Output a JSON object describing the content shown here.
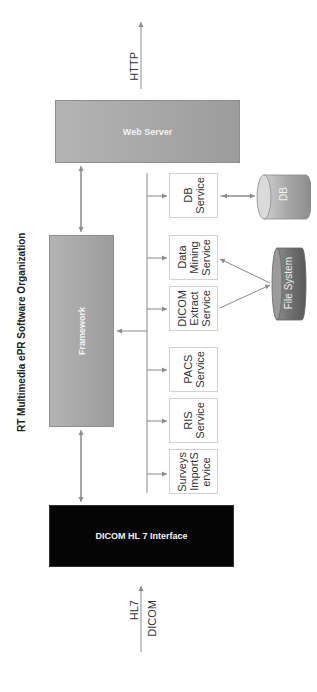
{
  "title": "RT Multimedia ePR Software Organization",
  "protocols": {
    "top": "HTTP",
    "bottom_left": "HL7",
    "bottom_right": "DICOM"
  },
  "components": {
    "web_server": "Web Server",
    "framework": "Framework",
    "interface": "DICOM HL 7 Interface"
  },
  "services": [
    {
      "id": "db",
      "label": "DB\nService"
    },
    {
      "id": "data-mining",
      "label": "Data\nMining\nService"
    },
    {
      "id": "dicom-extract",
      "label": "DICOM\nExtract\nService"
    },
    {
      "id": "pacs",
      "label": "PACS\nService"
    },
    {
      "id": "ris",
      "label": "RIS\nService"
    },
    {
      "id": "surveys-import",
      "label": "Surveys\nImportS\nervice"
    }
  ],
  "storage": {
    "db": "DB",
    "file_system": "File System"
  },
  "colors": {
    "grey_box": "#a8a8a8",
    "black_box": "#050505",
    "line": "#8a8a8a",
    "cylinder_light": "#b8b8b8",
    "cylinder_dark": "#6e6e6e"
  }
}
